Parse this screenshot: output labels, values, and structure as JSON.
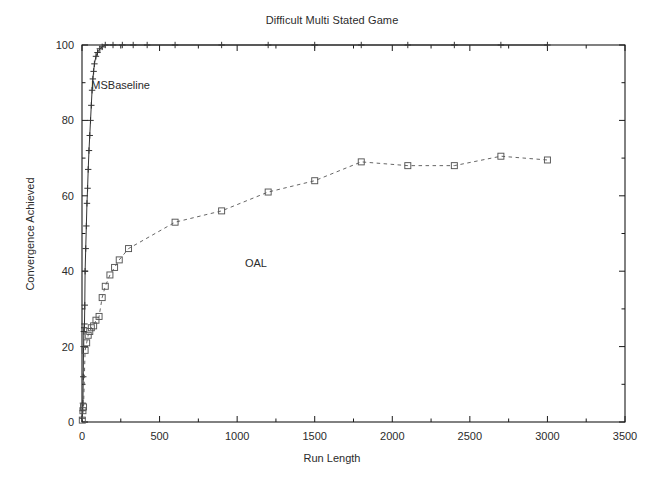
{
  "chart_data": {
    "type": "line",
    "title": "Difficult Multi Stated Game",
    "xlabel": "Run Length",
    "ylabel": "Convergence Achieved",
    "xlim": [
      0,
      3500
    ],
    "ylim": [
      0,
      100
    ],
    "xticks": [
      0,
      500,
      1000,
      1500,
      2000,
      2500,
      3000,
      3500
    ],
    "yticks": [
      0,
      20,
      40,
      60,
      80,
      100
    ],
    "grid": false,
    "legend_position": "inline-annotations",
    "series": [
      {
        "name": "MSBaseline",
        "marker": "plus",
        "linestyle": "solid",
        "color": "#333333",
        "label_x": 60,
        "label_y": 89,
        "points": [
          [
            2,
            1
          ],
          [
            4,
            3
          ],
          [
            6,
            5
          ],
          [
            8,
            12
          ],
          [
            10,
            20
          ],
          [
            12,
            24
          ],
          [
            14,
            25
          ],
          [
            16,
            26
          ],
          [
            18,
            31
          ],
          [
            20,
            40
          ],
          [
            24,
            46
          ],
          [
            28,
            52
          ],
          [
            32,
            58
          ],
          [
            36,
            62
          ],
          [
            40,
            67
          ],
          [
            45,
            72
          ],
          [
            50,
            76
          ],
          [
            55,
            80
          ],
          [
            60,
            84
          ],
          [
            65,
            88
          ],
          [
            70,
            91
          ],
          [
            75,
            93
          ],
          [
            80,
            95
          ],
          [
            90,
            97
          ],
          [
            100,
            98
          ],
          [
            115,
            99
          ],
          [
            130,
            99.5
          ],
          [
            150,
            100
          ],
          [
            200,
            100
          ],
          [
            260,
            100
          ],
          [
            330,
            100
          ],
          [
            420,
            100
          ],
          [
            600,
            100
          ],
          [
            900,
            100
          ],
          [
            1200,
            100
          ],
          [
            1500,
            100
          ],
          [
            1800,
            100
          ],
          [
            2100,
            100
          ],
          [
            2400,
            100
          ],
          [
            2700,
            100
          ],
          [
            3000,
            100
          ]
        ]
      },
      {
        "name": "OAL",
        "marker": "square",
        "linestyle": "dashed",
        "color": "#555555",
        "label_x": 1050,
        "label_y": 42,
        "points": [
          [
            2,
            0.5
          ],
          [
            6,
            3
          ],
          [
            10,
            4
          ],
          [
            20,
            19
          ],
          [
            30,
            21
          ],
          [
            40,
            23
          ],
          [
            50,
            24
          ],
          [
            60,
            25
          ],
          [
            75,
            25.5
          ],
          [
            90,
            27
          ],
          [
            110,
            28
          ],
          [
            130,
            33
          ],
          [
            150,
            36
          ],
          [
            180,
            39
          ],
          [
            210,
            41
          ],
          [
            240,
            43
          ],
          [
            300,
            46
          ],
          [
            600,
            53
          ],
          [
            900,
            56
          ],
          [
            1200,
            61
          ],
          [
            1500,
            64
          ],
          [
            1800,
            69
          ],
          [
            2100,
            68
          ],
          [
            2400,
            68
          ],
          [
            2700,
            70.5
          ],
          [
            3000,
            69.5
          ]
        ]
      }
    ]
  },
  "axes": {
    "plot_left_px": 82,
    "plot_right_px": 625,
    "plot_top_px": 45,
    "plot_bottom_px": 422
  }
}
